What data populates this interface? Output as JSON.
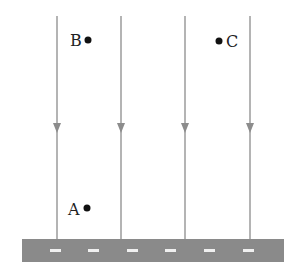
{
  "diagram": {
    "points": [
      {
        "label": "B",
        "x": 88,
        "y": 40,
        "label_side": "left"
      },
      {
        "label": "C",
        "x": 219,
        "y": 41,
        "label_side": "right"
      },
      {
        "label": "A",
        "x": 87,
        "y": 208,
        "label_side": "left"
      }
    ],
    "lines": [
      {
        "x": 57
      },
      {
        "x": 121
      },
      {
        "x": 185
      },
      {
        "x": 250
      }
    ],
    "line_top": 16,
    "line_bottom": 239,
    "arrow_y": 130,
    "road": {
      "x": 22,
      "y": 239,
      "width": 262,
      "height": 23,
      "color": "#8a8a8a",
      "dash_color": "#f0f0f0"
    },
    "line_color": "#8c8c8c",
    "point_color": "#111111"
  }
}
